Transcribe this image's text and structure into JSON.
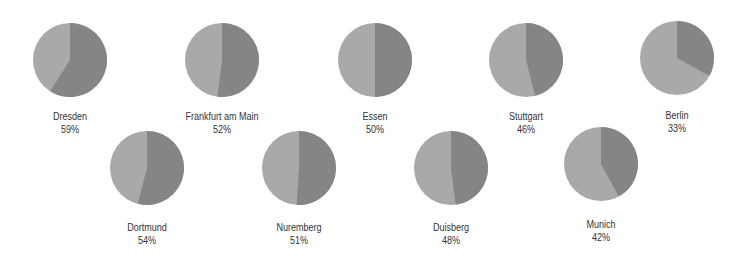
{
  "colors": {
    "value_slice": "#858585",
    "remainder_slice": "#a9a9a9",
    "background": "#ffffff",
    "text": "#333333"
  },
  "chart_data": {
    "type": "pie",
    "title": "",
    "legend": null,
    "items": [
      {
        "city": "Dresden",
        "value": 59,
        "label": "59%"
      },
      {
        "city": "Frankfurt am Main",
        "value": 52,
        "label": "52%"
      },
      {
        "city": "Essen",
        "value": 50,
        "label": "50%"
      },
      {
        "city": "Stuttgart",
        "value": 46,
        "label": "46%"
      },
      {
        "city": "Berlin",
        "value": 33,
        "label": "33%"
      },
      {
        "city": "Dortmund",
        "value": 54,
        "label": "54%"
      },
      {
        "city": "Nuremberg",
        "value": 51,
        "label": "51%"
      },
      {
        "city": "Duisberg",
        "value": 48,
        "label": "48%"
      },
      {
        "city": "Munich",
        "value": 42,
        "label": "42%"
      }
    ]
  },
  "layout": [
    {
      "cx": 70,
      "cy": 60,
      "label_y": 109
    },
    {
      "cx": 222,
      "cy": 60,
      "label_y": 109
    },
    {
      "cx": 375,
      "cy": 60,
      "label_y": 109
    },
    {
      "cx": 526,
      "cy": 60,
      "label_y": 109
    },
    {
      "cx": 677,
      "cy": 58,
      "label_y": 108
    },
    {
      "cx": 147,
      "cy": 168,
      "label_y": 220
    },
    {
      "cx": 299,
      "cy": 168,
      "label_y": 220
    },
    {
      "cx": 451,
      "cy": 168,
      "label_y": 220
    },
    {
      "cx": 601,
      "cy": 164,
      "label_y": 217
    }
  ],
  "radius": 37
}
